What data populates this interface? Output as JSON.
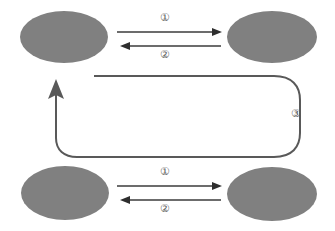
{
  "diagram": {
    "colors": {
      "node_fill": "#808080",
      "arrow_stroke": "#3b3b3b",
      "loop_stroke": "#595959",
      "background": "#ffffff",
      "label_text": "#5a5a5a"
    },
    "nodes": [
      {
        "id": "top-left",
        "label": "",
        "cx": 64,
        "cy": 37,
        "rx": 44,
        "ry": 26
      },
      {
        "id": "top-right",
        "label": "",
        "cx": 272,
        "cy": 37,
        "rx": 45,
        "ry": 26
      },
      {
        "id": "bottom-left",
        "label": "",
        "cx": 65,
        "cy": 193,
        "rx": 44,
        "ry": 27
      },
      {
        "id": "bottom-right",
        "label": "",
        "cx": 272,
        "cy": 194,
        "rx": 45,
        "ry": 27
      }
    ],
    "edges": [
      {
        "id": "top-forward",
        "label": "①",
        "from": "top-left",
        "to": "top-right",
        "direction": "right"
      },
      {
        "id": "top-back",
        "label": "②",
        "from": "top-right",
        "to": "top-left",
        "direction": "left"
      },
      {
        "id": "bottom-forward",
        "label": "①",
        "from": "bottom-left",
        "to": "bottom-right",
        "direction": "right"
      },
      {
        "id": "bottom-back",
        "label": "②",
        "from": "bottom-right",
        "to": "bottom-left",
        "direction": "left"
      },
      {
        "id": "return-loop",
        "label": "③",
        "from": "bottom-right",
        "to": "top-left",
        "direction": "up",
        "shape": "rounded-rectangle-loop"
      }
    ]
  }
}
